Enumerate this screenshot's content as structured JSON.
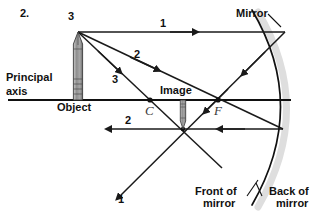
{
  "figure": {
    "number_label": "2.",
    "title_kind": "concave-mirror-ray-diagram",
    "colors": {
      "ink": "#111111",
      "ray": "#1a1a1a",
      "axis": "#111111",
      "mirror": "#111111",
      "object_body": "#8c8c8c",
      "object_outline": "#3b3b3b",
      "mirror_shadow": "#d9d9d9",
      "page": "#ffffff"
    }
  },
  "labels": {
    "problem_number": "2.",
    "principal_axis_line1": "Principal",
    "principal_axis_line2": "axis",
    "object": "Object",
    "image": "Image",
    "center_of_curvature": "C",
    "focal_point": "F",
    "mirror": "Mirror",
    "front_of_mirror_line1": "Front of",
    "front_of_mirror_line2": "mirror",
    "back_of_mirror_line1": "Back of",
    "back_of_mirror_line2": "mirror"
  },
  "rays": [
    {
      "id": "ray-1-incident",
      "number": "1",
      "label_x": 160,
      "label_y": 25
    },
    {
      "id": "ray-2-incident",
      "number": "2",
      "label_x": 134,
      "label_y": 56
    },
    {
      "id": "ray-3-incident",
      "number": "3",
      "label_x": 112,
      "label_y": 81
    },
    {
      "id": "ray-2-reflected",
      "number": "2",
      "label_x": 125,
      "label_y": 122
    },
    {
      "id": "ray-1-reflected",
      "number": "1",
      "label_x": 118,
      "label_y": 200
    },
    {
      "id": "object-tip-number",
      "number": "3",
      "label_x": 68,
      "label_y": 18
    }
  ],
  "geometry": {
    "principal_axis_y": 100,
    "object_x": 78,
    "object_tip_y": 32,
    "image_x": 183,
    "image_foot_y": 129,
    "center_of_curvature_x": 150,
    "focal_point_x": 218,
    "mirror_vertex_x": 291,
    "ray1_mirror_hit": [
      285,
      32
    ],
    "ray2_mirror_hit": [
      283,
      129
    ],
    "convergence_point": [
      183,
      129
    ]
  }
}
